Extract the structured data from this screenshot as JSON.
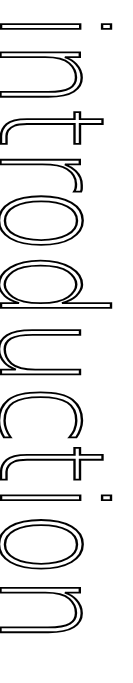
{
  "heading": {
    "text": "introduction",
    "orientation": "vertical, rotated 90deg clockwise",
    "color": "#000000",
    "background": "#ffffff"
  }
}
